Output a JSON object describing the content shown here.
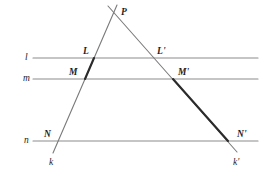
{
  "figure": {
    "canvas": {
      "width": 271,
      "height": 180,
      "background": "#ffffff"
    },
    "colors": {
      "parallel_line": "#8c8c8c",
      "transversal_thin": "#7a7a7a",
      "transversal_bold": "#2b2b2b",
      "label_text": "#1d1d1d"
    },
    "parallel_lines": [
      {
        "id": "l",
        "label": "l",
        "y": 58,
        "x1": 33,
        "x2": 258,
        "label_x": 25,
        "label_y": 53
      },
      {
        "id": "m",
        "label": "m",
        "y": 79,
        "x1": 33,
        "x2": 258,
        "label_x": 23,
        "label_y": 74
      },
      {
        "id": "n",
        "label": "n",
        "y": 141,
        "x1": 33,
        "x2": 258,
        "label_x": 24,
        "label_y": 136
      }
    ],
    "transversals": [
      {
        "id": "k",
        "label": "k",
        "from": {
          "x": 117,
          "y": 5
        },
        "to": {
          "x": 53,
          "y": 153
        },
        "label_x": 49,
        "label_y": 158,
        "bold_from": {
          "x": 94,
          "y": 58
        },
        "bold_to": {
          "x": 85,
          "y": 79
        }
      },
      {
        "id": "k'",
        "label": "k'",
        "from": {
          "x": 108,
          "y": 6
        },
        "to": {
          "x": 237,
          "y": 152
        },
        "label_x": 233,
        "label_y": 158,
        "bold_from": {
          "x": 173,
          "y": 79
        },
        "bold_to": {
          "x": 228,
          "y": 141
        }
      }
    ],
    "points": [
      {
        "id": "P",
        "label": "P",
        "x": 113,
        "y": 13,
        "label_x": 121,
        "label_y": 8
      },
      {
        "id": "L",
        "label": "L",
        "x": 94,
        "y": 58,
        "label_x": 83,
        "label_y": 47
      },
      {
        "id": "Lp",
        "label": "L'",
        "x": 152,
        "y": 58,
        "label_x": 157,
        "label_y": 47
      },
      {
        "id": "M",
        "label": "M",
        "x": 85,
        "y": 79,
        "label_x": 69,
        "label_y": 68
      },
      {
        "id": "Mp",
        "label": "M'",
        "x": 173,
        "y": 79,
        "label_x": 178,
        "label_y": 68
      },
      {
        "id": "N",
        "label": "N",
        "x": 56,
        "y": 141,
        "label_x": 44,
        "label_y": 130
      },
      {
        "id": "Np",
        "label": "N'",
        "x": 228,
        "y": 141,
        "label_x": 237,
        "label_y": 130
      }
    ]
  }
}
